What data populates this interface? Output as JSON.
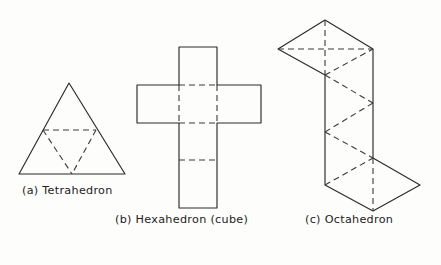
{
  "figure": {
    "background_color": "#fdfdfc",
    "line_color": "#2b2b2b",
    "fold_line_color": "#3a3a3a",
    "fold_line_style": "dashed"
  },
  "panels": [
    {
      "key": "tetrahedron",
      "label": "(a) Tetrahedron",
      "caption_x": 22,
      "caption_y": 194,
      "face_count": 4,
      "face_shape": "equilateral triangle",
      "outline_points": "69,83 125,174 19,174",
      "fold_points": [
        "43,130 96,130",
        "43,130 72,174",
        "96,130 72,174"
      ]
    },
    {
      "key": "hexahedron",
      "label": "(b) Hexahedron (cube)",
      "caption_x": 115,
      "caption_y": 223,
      "face_count": 6,
      "face_shape": "square",
      "outline_points": "179,47 217,47 217,85 261,85 261,123 217,123 217,208 179,208 179,123 137,123 137,85 179,85",
      "fold_points": [
        "179,85 217,85",
        "179,123 217,123",
        "179,85 179,123",
        "217,85 217,123",
        "179,160 217,160"
      ]
    },
    {
      "key": "octahedron",
      "label": "(c) Octahedron",
      "caption_x": 305,
      "caption_y": 223,
      "face_count": 8,
      "face_shape": "equilateral triangle",
      "outline_points": "325,20 373,49 373,158 420,185 373,211 325,185 325,75 278,49",
      "fold_points": [
        "325,20 325,75",
        "278,49 373,49",
        "325,75 373,49",
        "325,75 373,103",
        "325,132 373,103",
        "325,132 373,158",
        "325,185 373,158",
        "373,158 373,211",
        "325,75 325,132",
        "325,132 325,185"
      ]
    }
  ]
}
